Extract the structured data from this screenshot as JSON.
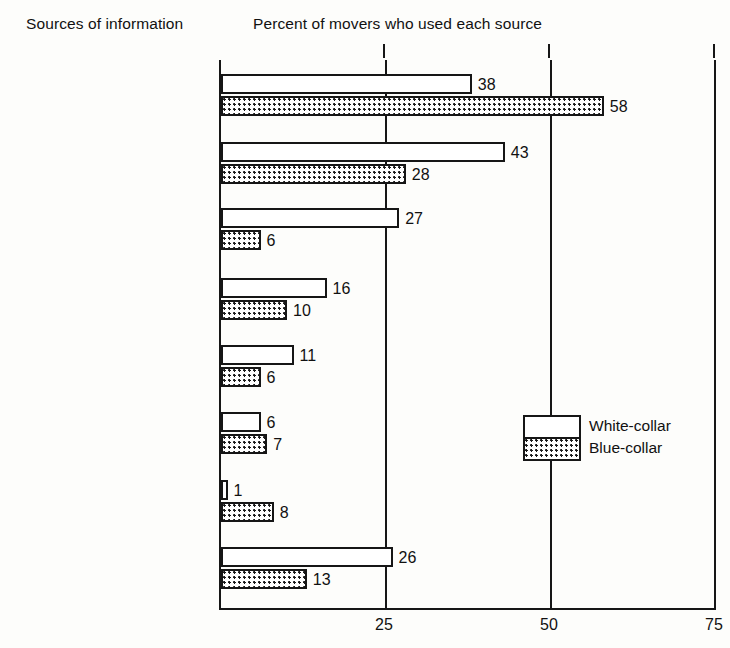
{
  "headings": {
    "left": "Sources of information",
    "right": "Percent of movers who used each source"
  },
  "legend": {
    "white_collar": "White-collar",
    "blue_collar": "Blue-collar"
  },
  "axis": {
    "ticks": [
      "25",
      "50",
      "75"
    ]
  },
  "chart_data": {
    "type": "bar",
    "orientation": "horizontal",
    "title": "Percent of movers who used each source",
    "xlabel": "Percent of movers who used each source",
    "ylabel": "Sources of information",
    "xlim": [
      0,
      75
    ],
    "xticks": [
      25,
      50,
      75
    ],
    "grid": true,
    "legend_position": "inside-right",
    "categories": [
      "Friends, relatives",
      "Special trip",
      "Employer or employer's\nrepresentative",
      "Newspaper ads",
      "Private employment\nagency",
      "State employment\nagency",
      "Union",
      "Other"
    ],
    "series": [
      {
        "name": "White-collar",
        "values": [
          38,
          43,
          27,
          16,
          11,
          6,
          1,
          26
        ]
      },
      {
        "name": "Blue-collar",
        "values": [
          58,
          28,
          6,
          10,
          6,
          7,
          8,
          13
        ]
      }
    ],
    "value_labels": {
      "white_collar": [
        "38",
        "43",
        "27",
        "16",
        "11",
        "6",
        "1",
        "26"
      ],
      "blue_collar": [
        "58",
        "28",
        "6",
        "10",
        "6",
        "7",
        "8",
        "13"
      ]
    }
  }
}
